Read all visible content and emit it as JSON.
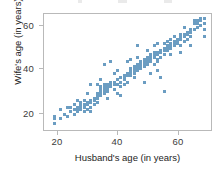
{
  "chart_data": {
    "type": "scatter",
    "title": "",
    "xlabel": "Husband's age (in years)",
    "ylabel": "Wife's age (in years)",
    "xlim": [
      16,
      66
    ],
    "ylim": [
      15,
      66
    ],
    "xticks": [
      20,
      40,
      60
    ],
    "yticks": [
      20,
      40,
      60
    ],
    "xticklabels": [
      "20",
      "40",
      "60"
    ],
    "yticklabels": [
      "20",
      "40",
      "60"
    ],
    "grid": false,
    "legend": null,
    "marker_color": "#6b9dc2",
    "marker_shape": "square",
    "axis_color": "#b9b9b9",
    "series": [
      {
        "name": "couples",
        "points": [
          [
            19,
            20
          ],
          [
            19,
            21
          ],
          [
            19,
            18
          ],
          [
            21,
            20
          ],
          [
            22,
            22
          ],
          [
            23,
            21
          ],
          [
            24,
            23
          ],
          [
            24,
            25
          ],
          [
            25,
            24
          ],
          [
            25,
            26
          ],
          [
            25,
            22
          ],
          [
            26,
            24
          ],
          [
            26,
            25
          ],
          [
            26,
            23
          ],
          [
            27,
            25
          ],
          [
            27,
            26
          ],
          [
            27,
            24
          ],
          [
            27,
            27
          ],
          [
            28,
            25
          ],
          [
            28,
            26
          ],
          [
            28,
            23
          ],
          [
            28,
            28
          ],
          [
            29,
            26
          ],
          [
            29,
            27
          ],
          [
            29,
            24
          ],
          [
            30,
            27
          ],
          [
            30,
            28
          ],
          [
            30,
            25
          ],
          [
            30,
            23
          ],
          [
            31,
            28
          ],
          [
            31,
            29
          ],
          [
            31,
            26
          ],
          [
            32,
            29
          ],
          [
            32,
            30
          ],
          [
            32,
            31
          ],
          [
            32,
            27
          ],
          [
            33,
            31
          ],
          [
            33,
            32
          ],
          [
            33,
            33
          ],
          [
            33,
            30
          ],
          [
            33,
            34
          ],
          [
            34,
            32
          ],
          [
            34,
            33
          ],
          [
            34,
            31
          ],
          [
            34,
            34
          ],
          [
            34,
            35
          ],
          [
            35,
            33
          ],
          [
            35,
            34
          ],
          [
            35,
            35
          ],
          [
            35,
            32
          ],
          [
            36,
            35
          ],
          [
            36,
            34
          ],
          [
            36,
            36
          ],
          [
            37,
            35
          ],
          [
            37,
            36
          ],
          [
            37,
            33
          ],
          [
            38,
            35
          ],
          [
            38,
            37
          ],
          [
            38,
            31
          ],
          [
            39,
            36
          ],
          [
            39,
            38
          ],
          [
            39,
            34
          ],
          [
            40,
            38
          ],
          [
            40,
            39
          ],
          [
            40,
            37
          ],
          [
            41,
            39
          ],
          [
            41,
            40
          ],
          [
            41,
            36
          ],
          [
            42,
            40
          ],
          [
            42,
            41
          ],
          [
            42,
            39
          ],
          [
            42,
            42
          ],
          [
            43,
            41
          ],
          [
            43,
            42
          ],
          [
            43,
            40
          ],
          [
            43,
            43
          ],
          [
            43,
            38
          ],
          [
            44,
            42
          ],
          [
            44,
            43
          ],
          [
            44,
            41
          ],
          [
            44,
            44
          ],
          [
            45,
            43
          ],
          [
            45,
            44
          ],
          [
            45,
            42
          ],
          [
            45,
            45
          ],
          [
            46,
            44
          ],
          [
            46,
            45
          ],
          [
            46,
            43
          ],
          [
            46,
            46
          ],
          [
            47,
            45
          ],
          [
            47,
            46
          ],
          [
            47,
            47
          ],
          [
            47,
            44
          ],
          [
            48,
            46
          ],
          [
            48,
            47
          ],
          [
            48,
            48
          ],
          [
            48,
            45
          ],
          [
            49,
            47
          ],
          [
            49,
            48
          ],
          [
            49,
            44
          ],
          [
            49,
            49
          ],
          [
            50,
            48
          ],
          [
            50,
            49
          ],
          [
            50,
            46
          ],
          [
            50,
            45
          ],
          [
            51,
            49
          ],
          [
            51,
            50
          ],
          [
            51,
            47
          ],
          [
            52,
            50
          ],
          [
            52,
            51
          ],
          [
            52,
            48
          ],
          [
            52,
            53
          ],
          [
            53,
            51
          ],
          [
            53,
            52
          ],
          [
            53,
            50
          ],
          [
            53,
            54
          ],
          [
            54,
            52
          ],
          [
            54,
            53
          ],
          [
            54,
            51
          ],
          [
            54,
            55
          ],
          [
            55,
            53
          ],
          [
            55,
            54
          ],
          [
            55,
            52
          ],
          [
            55,
            56
          ],
          [
            56,
            54
          ],
          [
            56,
            55
          ],
          [
            56,
            53
          ],
          [
            57,
            55
          ],
          [
            57,
            56
          ],
          [
            57,
            52
          ],
          [
            57,
            57
          ],
          [
            58,
            56
          ],
          [
            58,
            57
          ],
          [
            58,
            54
          ],
          [
            59,
            57
          ],
          [
            59,
            58
          ],
          [
            59,
            55
          ],
          [
            60,
            58
          ],
          [
            60,
            59
          ],
          [
            60,
            56
          ],
          [
            61,
            59
          ],
          [
            61,
            62
          ],
          [
            61,
            63
          ],
          [
            62,
            62
          ],
          [
            62,
            63
          ],
          [
            62,
            60
          ],
          [
            63,
            63
          ],
          [
            63,
            64
          ],
          [
            63,
            61
          ],
          [
            64,
            64
          ],
          [
            64,
            62
          ],
          [
            64,
            59
          ],
          [
            64,
            56
          ],
          [
            51,
            38
          ],
          [
            52,
            32
          ],
          [
            50,
            41
          ],
          [
            44,
            52
          ],
          [
            41,
            45
          ],
          [
            36,
            45
          ],
          [
            34,
            44
          ],
          [
            30,
            35
          ],
          [
            35,
            29
          ],
          [
            33,
            37
          ],
          [
            38,
            41
          ],
          [
            39,
            30
          ],
          [
            46,
            36
          ],
          [
            48,
            40
          ],
          [
            57,
            49
          ],
          [
            60,
            52
          ],
          [
            47,
            50
          ],
          [
            44,
            47
          ],
          [
            40,
            35
          ],
          [
            29,
            31
          ],
          [
            26,
            28
          ],
          [
            23,
            25
          ],
          [
            21,
            24
          ],
          [
            32,
            35
          ],
          [
            37,
            40
          ],
          [
            42,
            46
          ],
          [
            49,
            52
          ],
          [
            54,
            48
          ],
          [
            58,
            60
          ],
          [
            50,
            53
          ]
        ]
      }
    ]
  },
  "axes": {
    "ylabel": "Wife's age (in years)",
    "xlabel": "Husband's age (in years)",
    "yticklabels": [
      "60",
      "40",
      "20"
    ],
    "xticklabels": [
      "20",
      "40",
      "60"
    ]
  }
}
